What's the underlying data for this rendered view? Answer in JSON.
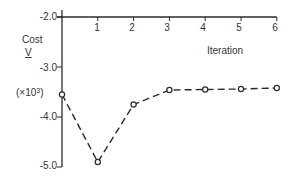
{
  "chart_data": {
    "type": "line",
    "title": "",
    "xlabel": "Iteration",
    "ylabel": "Cost",
    "ylabel_symbol": "V",
    "ylabel_scale": "(×10³)",
    "x": [
      0,
      1,
      2,
      3,
      4,
      5,
      6
    ],
    "series": [
      {
        "name": "Cost V",
        "values": [
          -3.55,
          -4.9,
          -3.75,
          -3.46,
          -3.45,
          -3.44,
          -3.42
        ]
      }
    ],
    "xlim": [
      0,
      6
    ],
    "ylim": [
      -5.0,
      -2.0
    ],
    "xticks": [
      "1",
      "2",
      "3",
      "4",
      "5",
      "6"
    ],
    "yticks": [
      "-2.0",
      "-3.0",
      "-4.0",
      "-5.0"
    ],
    "yticks_values": [
      -2.0,
      -3.0,
      -4.0,
      -5.0
    ],
    "x_axis_position": "top",
    "grid": false,
    "line_style": "dashed",
    "marker": "open-circle"
  },
  "colors": {
    "ink": "#2a2a2a",
    "background": "#ffffff"
  }
}
